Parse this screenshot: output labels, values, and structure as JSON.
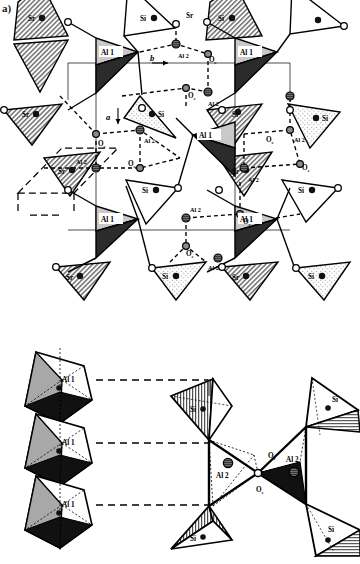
{
  "figure": {
    "panel_a_label": "a)"
  },
  "axes": {
    "a": "a",
    "b": "b"
  },
  "legend_labels": {
    "al1": "Al 1",
    "al2": "Al 2",
    "si": "Si",
    "sr": "Sr",
    "oc": "O",
    "oc_sub": "c"
  },
  "panel_a": {
    "name": "projection-panel",
    "al1_labels": [
      "Al 1",
      "Al 1",
      "Al 1",
      "Al 1",
      "Al 1"
    ],
    "al2_labels": [
      "Al 2",
      "Al 2",
      "Al 2",
      "Al 2",
      "Al 2",
      "Al 2",
      "Al 2"
    ],
    "oc_labels": [
      "O",
      "O",
      "O",
      "O",
      "O",
      "O",
      "O"
    ],
    "si_labels": [
      "Si",
      "Si",
      "Si",
      "Si",
      "Si",
      "Si",
      "Si",
      "Si"
    ],
    "sr_labels": [
      "Sr",
      "Sr",
      "Sr",
      "Sr",
      "Sr",
      "Sr",
      "Sr",
      "Sr"
    ]
  },
  "panel_b": {
    "name": "polyhedra-panel",
    "al1_labels": [
      "Al 1",
      "Al 1",
      "Al 1"
    ],
    "al2_labels": [
      "Al 2",
      "Al 2"
    ],
    "oc_labels": [
      "O",
      "O"
    ],
    "si_labels": [
      "Si",
      "Si",
      "Si",
      "Si"
    ]
  },
  "colors": {
    "al1_light": "#c9c9c9",
    "al1_dark": "#2b2b2b",
    "stroke": "#000000",
    "atom_fill_dark": "#1a1a1a",
    "atom_fill_gray": "#8a8a8a",
    "octahedron_shade": "#a8a8a8",
    "background": "#ffffff"
  }
}
